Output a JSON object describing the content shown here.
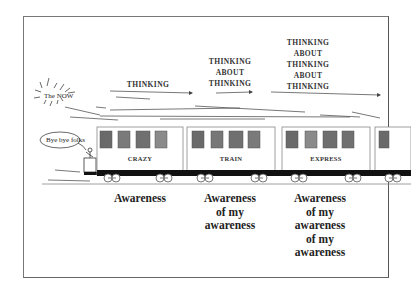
{
  "diagram": {
    "the_now": "The NOW",
    "speech": "Bye bye folks",
    "thoughts": [
      {
        "lines": [
          "THINKING"
        ]
      },
      {
        "lines": [
          "THINKING",
          "ABOUT",
          "THINKING"
        ]
      },
      {
        "lines": [
          "THINKING",
          "ABOUT",
          "THINKING",
          "ABOUT",
          "THINKING"
        ]
      }
    ],
    "cars": [
      {
        "name": "CRAZY"
      },
      {
        "name": "TRAIN"
      },
      {
        "name": "EXPRESS"
      }
    ],
    "captions": [
      {
        "lines": [
          "Awareness"
        ]
      },
      {
        "lines": [
          "Awareness",
          "of my",
          "awareness"
        ]
      },
      {
        "lines": [
          "Awareness",
          "of my",
          "awareness",
          "of my",
          "awareness"
        ]
      }
    ],
    "colors": {
      "window": "#707070",
      "window_light": "#8a8a8a",
      "chassis": "#111111",
      "outline": "#888888"
    }
  }
}
